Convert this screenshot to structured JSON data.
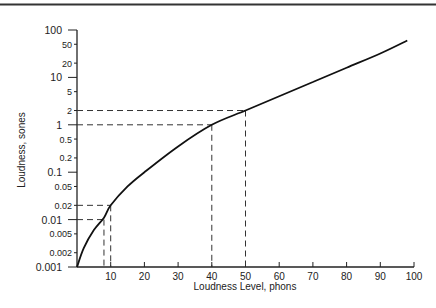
{
  "chart_data": {
    "type": "line",
    "title": "",
    "xlabel": "Loudness Level, phons",
    "ylabel": "Loudness, sones",
    "xlim": [
      0,
      100
    ],
    "ylim": [
      0.001,
      100
    ],
    "yscale": "log",
    "grid": false,
    "x_ticks": [
      10,
      20,
      30,
      40,
      50,
      60,
      70,
      80,
      90,
      100
    ],
    "y_ticks": [
      {
        "value": 100,
        "label": "100",
        "major": true
      },
      {
        "value": 50,
        "label": "50",
        "major": false
      },
      {
        "value": 20,
        "label": "20",
        "major": false
      },
      {
        "value": 10,
        "label": "10",
        "major": true
      },
      {
        "value": 5,
        "label": "5",
        "major": false
      },
      {
        "value": 2,
        "label": "2",
        "major": false
      },
      {
        "value": 1,
        "label": "1",
        "major": true
      },
      {
        "value": 0.5,
        "label": "0.5",
        "major": false
      },
      {
        "value": 0.2,
        "label": "0.2",
        "major": false
      },
      {
        "value": 0.1,
        "label": "0.1",
        "major": true
      },
      {
        "value": 0.05,
        "label": "0.05",
        "major": false
      },
      {
        "value": 0.02,
        "label": "0.02",
        "major": false
      },
      {
        "value": 0.01,
        "label": "0.01",
        "major": true
      },
      {
        "value": 0.005,
        "label": "0.005",
        "major": false
      },
      {
        "value": 0.002,
        "label": "0.002",
        "major": false
      },
      {
        "value": 0.001,
        "label": "0.001",
        "major": true
      }
    ],
    "series": [
      {
        "name": "Loudness vs loudness level",
        "x": [
          0,
          2,
          5,
          8,
          10,
          15,
          20,
          30,
          40,
          50,
          60,
          70,
          80,
          90,
          98
        ],
        "y": [
          0.001,
          0.0025,
          0.006,
          0.011,
          0.02,
          0.05,
          0.1,
          0.35,
          1,
          2,
          4,
          8,
          16,
          32,
          60
        ]
      }
    ],
    "reference_lines": [
      {
        "phons": 50,
        "sones": 2
      },
      {
        "phons": 40,
        "sones": 1
      },
      {
        "phons": 10,
        "sones": 0.02
      },
      {
        "phons": 8,
        "sones": 0.01
      }
    ]
  }
}
